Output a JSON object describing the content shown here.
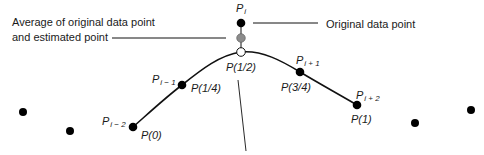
{
  "annotations": {
    "average_label_line1": "Average of original data point",
    "average_label_line2": "and estimated point",
    "original_label": "Original data point"
  },
  "points": {
    "p_i": {
      "name": "P",
      "sub": "i"
    },
    "p_i_minus_1": {
      "name": "P",
      "sub": "i − 1",
      "param": "P(1/4)"
    },
    "p_i_minus_2": {
      "name": "P",
      "sub": "i − 2",
      "param": "P(0)"
    },
    "p_i_plus_1": {
      "name": "P",
      "sub": "i + 1",
      "param": "P(3/4)"
    },
    "p_i_plus_2": {
      "name": "P",
      "sub": "i + 2",
      "param": "P(1)"
    },
    "midpoint": {
      "param": "P(1/2)"
    }
  },
  "colors": {
    "original_point": "#000000",
    "average_point": "#8c8c8c",
    "estimated_point": "#ffffff",
    "curve": "#111111"
  }
}
